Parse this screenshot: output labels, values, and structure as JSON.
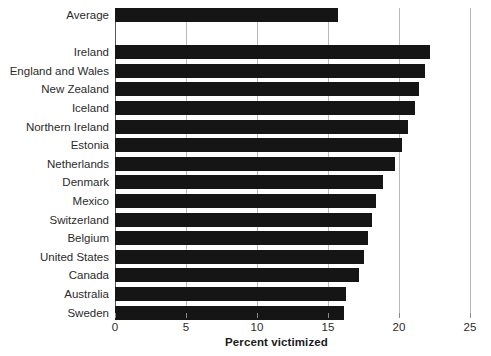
{
  "chart_data": {
    "type": "bar",
    "orientation": "horizontal",
    "title": "",
    "subtitle": "",
    "xlabel": "Percent victimized",
    "ylabel": "",
    "xlim": [
      0,
      25
    ],
    "xticks": [
      0,
      5,
      10,
      15,
      20,
      25
    ],
    "xtick_labels": [
      "0",
      "5",
      "10",
      "15",
      "20",
      "25"
    ],
    "grid": "vertical",
    "legend": "none",
    "bar_color": "#151515",
    "gridline_color": "#b9b9b9",
    "axis_color": "#555555",
    "categories": [
      "Average",
      "Ireland",
      "England and Wales",
      "New Zealand",
      "Iceland",
      "Northern Ireland",
      "Estonia",
      "Netherlands",
      "Denmark",
      "Mexico",
      "Switzerland",
      "Belgium",
      "United States",
      "Canada",
      "Australia",
      "Sweden"
    ],
    "values": [
      15.7,
      22.2,
      21.8,
      21.4,
      21.1,
      20.6,
      20.2,
      19.7,
      18.9,
      18.4,
      18.1,
      17.8,
      17.5,
      17.2,
      16.3,
      16.1
    ],
    "gap_after_index": 0
  },
  "chart": {
    "x_axis_title": "Percent victimized"
  }
}
